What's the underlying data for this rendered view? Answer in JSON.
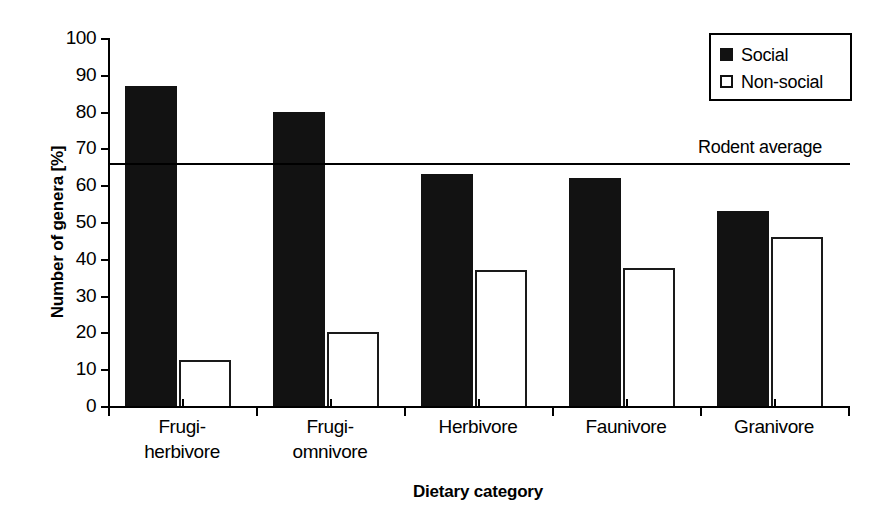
{
  "chart_data": {
    "type": "bar",
    "title": "",
    "xlabel": "Dietary category",
    "ylabel": "Number of genera [%]",
    "categories": [
      "Frugi-\nherbivore",
      "Frugi-\nomnivore",
      "Herbivore",
      "Faunivore",
      "Granivore"
    ],
    "category_lines": [
      [
        "Frugi-",
        "herbivore"
      ],
      [
        "Frugi-",
        "omnivore"
      ],
      [
        "Herbivore",
        ""
      ],
      [
        "Faunivore",
        ""
      ],
      [
        "Granivore",
        ""
      ]
    ],
    "series": [
      {
        "name": "Social",
        "color": "#121212",
        "fill": "solid",
        "values": [
          87,
          80,
          63,
          62,
          53
        ]
      },
      {
        "name": "Non-social",
        "color": "#ffffff",
        "fill": "open",
        "values": [
          12.5,
          20,
          37,
          37.5,
          46
        ]
      }
    ],
    "ylim": [
      0,
      100
    ],
    "ytick_step": 10,
    "yticks": [
      100,
      90,
      80,
      70,
      60,
      50,
      40,
      30,
      20,
      10,
      0
    ],
    "xlim_note": "categorical, 5 groups",
    "grid": false,
    "legend_position": "top-right",
    "annotations": [
      {
        "name": "rodent-average",
        "type": "horizontal-reference-line",
        "label": "Rodent average",
        "value": 66,
        "color": "#000000"
      }
    ]
  },
  "legend": {
    "items": [
      {
        "label": "Social",
        "swatch": "filled-square-icon"
      },
      {
        "label": "Non-social",
        "swatch": "open-square-icon"
      }
    ]
  },
  "axes": {
    "y_title": "Number of genera [%]",
    "x_title": "Dietary category",
    "y_labels": [
      "100",
      "90",
      "80",
      "70",
      "60",
      "50",
      "40",
      "30",
      "20",
      "10",
      "0"
    ]
  }
}
